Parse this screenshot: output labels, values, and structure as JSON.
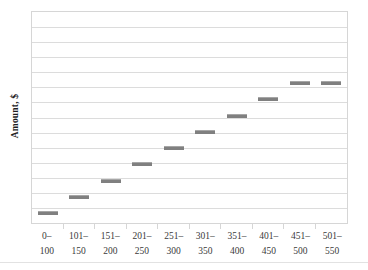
{
  "chart_data": {
    "type": "bar",
    "title": "",
    "subtitle": "",
    "xlabel": "",
    "ylabel": "Amount, $",
    "legend": [],
    "legend_position": "none",
    "grid": true,
    "grid_lines": 13,
    "orientation": "vertical-floating-bars",
    "note": "Each category is drawn as a short floating horizontal bar (range/step bar); the bars rise one gridline per category.",
    "categories": [
      "0–100",
      "101–150",
      "151–200",
      "201–250",
      "251–300",
      "301–350",
      "351–400",
      "401–450",
      "451–500",
      "501–550"
    ],
    "category_lines": [
      [
        "0–",
        "100"
      ],
      [
        "101–",
        "150"
      ],
      [
        "151–",
        "200"
      ],
      [
        "201–",
        "250"
      ],
      [
        "251–",
        "300"
      ],
      [
        "301–",
        "350"
      ],
      [
        "351–",
        "400"
      ],
      [
        "401–",
        "450"
      ],
      [
        "451–",
        "500"
      ],
      [
        "501–",
        "550"
      ]
    ],
    "values": [
      1,
      2,
      3,
      4,
      5,
      6,
      7,
      8,
      9,
      9
    ],
    "ylim": [
      0,
      13
    ],
    "bar_level_fraction": [
      0.038,
      0.115,
      0.192,
      0.269,
      0.346,
      0.423,
      0.5,
      0.577,
      0.654,
      0.654
    ],
    "bar_color": "#808080",
    "grid_color": "#dcdcdc",
    "plot_border_color": "#d6d6d6",
    "background_color": "#ffffff"
  },
  "axes": {
    "y_title": "Amount, $"
  }
}
